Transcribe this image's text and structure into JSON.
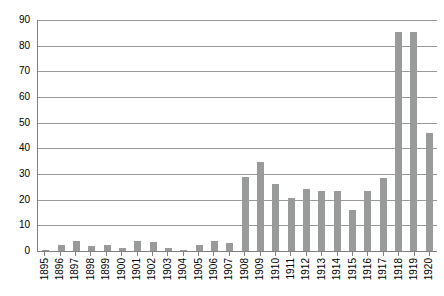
{
  "chart_data": {
    "type": "bar",
    "title": "",
    "xlabel": "",
    "ylabel": "",
    "grid": true,
    "legend": false,
    "ylim": [
      0,
      90
    ],
    "ytick_step": 10,
    "ytick_labels": [
      "90",
      "80",
      "70",
      "60",
      "50",
      "40",
      "30",
      "20",
      "10",
      "0"
    ],
    "ytick_values": [
      90,
      80,
      70,
      60,
      50,
      40,
      30,
      20,
      10,
      0
    ],
    "categories": [
      "1895",
      "1896",
      "1897",
      "1898",
      "1899",
      "1900",
      "1901",
      "1902",
      "1903",
      "1904",
      "1905",
      "1906",
      "1907",
      "1908",
      "1909",
      "1910",
      "1911",
      "1912",
      "1913",
      "1914",
      "1915",
      "1916",
      "1917",
      "1918",
      "1919",
      "1920"
    ],
    "values": [
      0.5,
      2.5,
      4,
      2,
      2.5,
      1,
      4,
      3.5,
      1,
      0.5,
      2.5,
      4,
      3,
      29,
      34.5,
      26,
      20.5,
      24,
      23.5,
      23.5,
      16,
      23.5,
      28.5,
      85.5,
      85.5,
      46
    ],
    "bar_color": "#999a9a",
    "gridline_color": "#9a9a9a",
    "axis_color": "#808080",
    "text_color": "#000000",
    "background_color": "#ffffff"
  }
}
